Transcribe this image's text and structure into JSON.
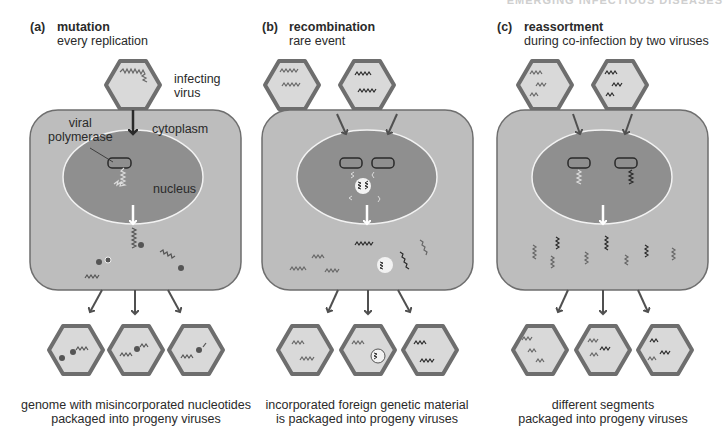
{
  "header_bleed": "EMERGING INFECTIOUS DISEASES",
  "colors": {
    "cytoplasm": "#bdbdbd",
    "nucleus": "#8f8f8f",
    "virus_fill": "#d9d9d9",
    "virus_border": "#6e6e6e",
    "arrow": "#505050",
    "text": "#2a2a2a"
  },
  "panels": [
    {
      "tag": "(a)",
      "title": "mutation",
      "subtitle": "every replication",
      "labels": {
        "infecting_virus": [
          "infecting",
          "virus"
        ],
        "viral_polymerase": [
          "viral",
          "polymerase"
        ],
        "cytoplasm": "cytoplasm",
        "nucleus": "nucleus"
      },
      "caption": [
        "genome with misincorporated nucleotides",
        "packaged into progeny viruses"
      ]
    },
    {
      "tag": "(b)",
      "title": "recombination",
      "subtitle": "rare event",
      "caption": [
        "incorporated foreign genetic material",
        "is packaged into progeny viruses"
      ]
    },
    {
      "tag": "(c)",
      "title": "reassortment",
      "subtitle": "during co-infection by two viruses",
      "caption": [
        "different segments",
        "packaged into progeny viruses"
      ]
    }
  ]
}
